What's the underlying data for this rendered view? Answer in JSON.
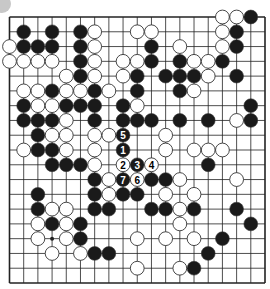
{
  "board": {
    "size": 19,
    "colors": {
      "line": "#222222",
      "black_stone": "#1a1a1a",
      "white_stone": "#ffffff",
      "stone_outline": "#333333",
      "corner_marker": "#c8c8c8"
    },
    "star_points_visible": [
      [
        3,
        15
      ]
    ],
    "stones": [
      {
        "c": 15,
        "r": 0,
        "color": "W"
      },
      {
        "c": 16,
        "r": 0,
        "color": "W"
      },
      {
        "c": 17,
        "r": 0,
        "color": "B"
      },
      {
        "c": 1,
        "r": 1,
        "color": "B"
      },
      {
        "c": 3,
        "r": 1,
        "color": "B"
      },
      {
        "c": 5,
        "r": 1,
        "color": "B"
      },
      {
        "c": 6,
        "r": 1,
        "color": "W"
      },
      {
        "c": 9,
        "r": 1,
        "color": "W"
      },
      {
        "c": 10,
        "r": 1,
        "color": "W"
      },
      {
        "c": 15,
        "r": 1,
        "color": "W"
      },
      {
        "c": 16,
        "r": 1,
        "color": "B"
      },
      {
        "c": 0,
        "r": 2,
        "color": "W"
      },
      {
        "c": 1,
        "r": 2,
        "color": "B"
      },
      {
        "c": 2,
        "r": 2,
        "color": "B"
      },
      {
        "c": 3,
        "r": 2,
        "color": "B"
      },
      {
        "c": 5,
        "r": 2,
        "color": "B"
      },
      {
        "c": 6,
        "r": 2,
        "color": "W"
      },
      {
        "c": 10,
        "r": 2,
        "color": "B"
      },
      {
        "c": 12,
        "r": 2,
        "color": "W"
      },
      {
        "c": 15,
        "r": 2,
        "color": "W"
      },
      {
        "c": 16,
        "r": 2,
        "color": "B"
      },
      {
        "c": 0,
        "r": 3,
        "color": "W"
      },
      {
        "c": 1,
        "r": 3,
        "color": "W"
      },
      {
        "c": 2,
        "r": 3,
        "color": "W"
      },
      {
        "c": 3,
        "r": 3,
        "color": "W"
      },
      {
        "c": 5,
        "r": 3,
        "color": "B"
      },
      {
        "c": 6,
        "r": 3,
        "color": "W"
      },
      {
        "c": 8,
        "r": 3,
        "color": "W"
      },
      {
        "c": 9,
        "r": 3,
        "color": "W"
      },
      {
        "c": 10,
        "r": 3,
        "color": "B"
      },
      {
        "c": 12,
        "r": 3,
        "color": "B"
      },
      {
        "c": 13,
        "r": 3,
        "color": "W"
      },
      {
        "c": 14,
        "r": 3,
        "color": "W"
      },
      {
        "c": 15,
        "r": 3,
        "color": "B"
      },
      {
        "c": 4,
        "r": 4,
        "color": "W"
      },
      {
        "c": 5,
        "r": 4,
        "color": "B"
      },
      {
        "c": 6,
        "r": 4,
        "color": "W"
      },
      {
        "c": 8,
        "r": 4,
        "color": "W"
      },
      {
        "c": 9,
        "r": 4,
        "color": "B"
      },
      {
        "c": 11,
        "r": 4,
        "color": "B"
      },
      {
        "c": 12,
        "r": 4,
        "color": "B"
      },
      {
        "c": 13,
        "r": 4,
        "color": "B"
      },
      {
        "c": 14,
        "r": 4,
        "color": "W"
      },
      {
        "c": 16,
        "r": 4,
        "color": "B"
      },
      {
        "c": 1,
        "r": 5,
        "color": "W"
      },
      {
        "c": 2,
        "r": 5,
        "color": "W"
      },
      {
        "c": 3,
        "r": 5,
        "color": "B"
      },
      {
        "c": 4,
        "r": 5,
        "color": "W"
      },
      {
        "c": 5,
        "r": 5,
        "color": "W"
      },
      {
        "c": 6,
        "r": 5,
        "color": "B"
      },
      {
        "c": 7,
        "r": 5,
        "color": "W"
      },
      {
        "c": 9,
        "r": 5,
        "color": "B"
      },
      {
        "c": 12,
        "r": 5,
        "color": "B"
      },
      {
        "c": 13,
        "r": 5,
        "color": "W"
      },
      {
        "c": 1,
        "r": 6,
        "color": "B"
      },
      {
        "c": 2,
        "r": 6,
        "color": "W"
      },
      {
        "c": 3,
        "r": 6,
        "color": "W"
      },
      {
        "c": 4,
        "r": 6,
        "color": "B"
      },
      {
        "c": 5,
        "r": 6,
        "color": "B"
      },
      {
        "c": 6,
        "r": 6,
        "color": "B"
      },
      {
        "c": 8,
        "r": 6,
        "color": "B"
      },
      {
        "c": 9,
        "r": 6,
        "color": "W"
      },
      {
        "c": 17,
        "r": 6,
        "color": "B"
      },
      {
        "c": 1,
        "r": 7,
        "color": "B"
      },
      {
        "c": 2,
        "r": 7,
        "color": "B"
      },
      {
        "c": 3,
        "r": 7,
        "color": "B"
      },
      {
        "c": 4,
        "r": 7,
        "color": "W"
      },
      {
        "c": 6,
        "r": 7,
        "color": "B"
      },
      {
        "c": 8,
        "r": 7,
        "color": "B"
      },
      {
        "c": 9,
        "r": 7,
        "color": "B"
      },
      {
        "c": 10,
        "r": 7,
        "color": "B"
      },
      {
        "c": 12,
        "r": 7,
        "color": "B"
      },
      {
        "c": 14,
        "r": 7,
        "color": "B"
      },
      {
        "c": 16,
        "r": 7,
        "color": "W"
      },
      {
        "c": 17,
        "r": 7,
        "color": "B"
      },
      {
        "c": 2,
        "r": 8,
        "color": "B"
      },
      {
        "c": 3,
        "r": 8,
        "color": "W"
      },
      {
        "c": 4,
        "r": 8,
        "color": "W"
      },
      {
        "c": 6,
        "r": 8,
        "color": "W"
      },
      {
        "c": 7,
        "r": 8,
        "color": "W"
      },
      {
        "c": 8,
        "r": 8,
        "color": "B",
        "label": "5"
      },
      {
        "c": 11,
        "r": 8,
        "color": "W"
      },
      {
        "c": 1,
        "r": 9,
        "color": "W"
      },
      {
        "c": 2,
        "r": 9,
        "color": "B"
      },
      {
        "c": 3,
        "r": 9,
        "color": "B"
      },
      {
        "c": 4,
        "r": 9,
        "color": "W"
      },
      {
        "c": 6,
        "r": 9,
        "color": "W"
      },
      {
        "c": 8,
        "r": 9,
        "color": "B",
        "label": "1"
      },
      {
        "c": 11,
        "r": 9,
        "color": "W"
      },
      {
        "c": 13,
        "r": 9,
        "color": "W"
      },
      {
        "c": 14,
        "r": 9,
        "color": "W"
      },
      {
        "c": 15,
        "r": 9,
        "color": "W"
      },
      {
        "c": 3,
        "r": 10,
        "color": "B"
      },
      {
        "c": 4,
        "r": 10,
        "color": "B"
      },
      {
        "c": 5,
        "r": 10,
        "color": "B"
      },
      {
        "c": 6,
        "r": 10,
        "color": "W"
      },
      {
        "c": 8,
        "r": 10,
        "color": "W",
        "label": "2"
      },
      {
        "c": 9,
        "r": 10,
        "color": "B",
        "label": "3"
      },
      {
        "c": 10,
        "r": 10,
        "color": "W",
        "label": "4"
      },
      {
        "c": 14,
        "r": 10,
        "color": "B"
      },
      {
        "c": 6,
        "r": 11,
        "color": "B"
      },
      {
        "c": 7,
        "r": 11,
        "color": "W"
      },
      {
        "c": 8,
        "r": 11,
        "color": "B",
        "label": "7"
      },
      {
        "c": 9,
        "r": 11,
        "color": "W",
        "label": "6"
      },
      {
        "c": 10,
        "r": 11,
        "color": "B"
      },
      {
        "c": 11,
        "r": 11,
        "color": "B"
      },
      {
        "c": 12,
        "r": 11,
        "color": "W"
      },
      {
        "c": 16,
        "r": 11,
        "color": "W"
      },
      {
        "c": 2,
        "r": 12,
        "color": "B"
      },
      {
        "c": 6,
        "r": 12,
        "color": "B"
      },
      {
        "c": 7,
        "r": 12,
        "color": "W"
      },
      {
        "c": 8,
        "r": 12,
        "color": "B"
      },
      {
        "c": 9,
        "r": 12,
        "color": "B"
      },
      {
        "c": 11,
        "r": 12,
        "color": "W"
      },
      {
        "c": 13,
        "r": 12,
        "color": "W"
      },
      {
        "c": 2,
        "r": 13,
        "color": "B"
      },
      {
        "c": 3,
        "r": 13,
        "color": "W"
      },
      {
        "c": 4,
        "r": 13,
        "color": "W"
      },
      {
        "c": 6,
        "r": 13,
        "color": "B"
      },
      {
        "c": 7,
        "r": 13,
        "color": "B"
      },
      {
        "c": 10,
        "r": 13,
        "color": "B"
      },
      {
        "c": 11,
        "r": 13,
        "color": "B"
      },
      {
        "c": 12,
        "r": 13,
        "color": "W"
      },
      {
        "c": 13,
        "r": 13,
        "color": "B"
      },
      {
        "c": 16,
        "r": 13,
        "color": "B"
      },
      {
        "c": 2,
        "r": 14,
        "color": "W"
      },
      {
        "c": 3,
        "r": 14,
        "color": "B"
      },
      {
        "c": 4,
        "r": 14,
        "color": "W"
      },
      {
        "c": 5,
        "r": 14,
        "color": "B"
      },
      {
        "c": 12,
        "r": 14,
        "color": "W"
      },
      {
        "c": 17,
        "r": 14,
        "color": "B"
      },
      {
        "c": 2,
        "r": 15,
        "color": "W"
      },
      {
        "c": 4,
        "r": 15,
        "color": "W"
      },
      {
        "c": 5,
        "r": 15,
        "color": "B"
      },
      {
        "c": 9,
        "r": 15,
        "color": "W"
      },
      {
        "c": 11,
        "r": 15,
        "color": "W"
      },
      {
        "c": 13,
        "r": 15,
        "color": "W"
      },
      {
        "c": 15,
        "r": 15,
        "color": "B"
      },
      {
        "c": 3,
        "r": 16,
        "color": "W"
      },
      {
        "c": 5,
        "r": 16,
        "color": "W"
      },
      {
        "c": 6,
        "r": 16,
        "color": "B"
      },
      {
        "c": 7,
        "r": 16,
        "color": "B"
      },
      {
        "c": 14,
        "r": 16,
        "color": "B"
      },
      {
        "c": 9,
        "r": 17,
        "color": "W"
      },
      {
        "c": 12,
        "r": 17,
        "color": "W"
      },
      {
        "c": 13,
        "r": 17,
        "color": "B"
      }
    ]
  }
}
